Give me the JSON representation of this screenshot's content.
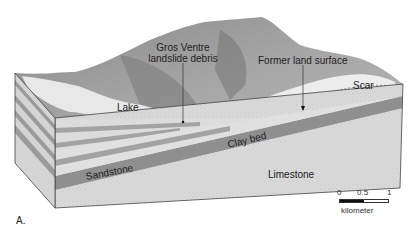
{
  "figure": {
    "panel_label": "A.",
    "labels": {
      "gros_ventre_line1": "Gros Ventre",
      "gros_ventre_line2": "landslide debris",
      "former_land_surface": "Former land surface",
      "scar": "Scar",
      "lake": "Lake",
      "clay_bed": "Clay bed",
      "sandstone": "Sandstone",
      "limestone": "Limestone"
    },
    "scale_bar": {
      "ticks": [
        "0",
        "0.5",
        "1"
      ],
      "unit": "kilometer"
    },
    "colors": {
      "terrain": "#9a9a9a",
      "terrain_dark": "#6e6e6e",
      "lake": "#e6e6e6",
      "scar": "#ececec",
      "clay_bed": "#8f8f8f",
      "sandstone_light": "#dcdcdc",
      "sandstone_dark": "#a3a3a3",
      "limestone": "#d8d8d8",
      "outline": "#444444"
    }
  }
}
